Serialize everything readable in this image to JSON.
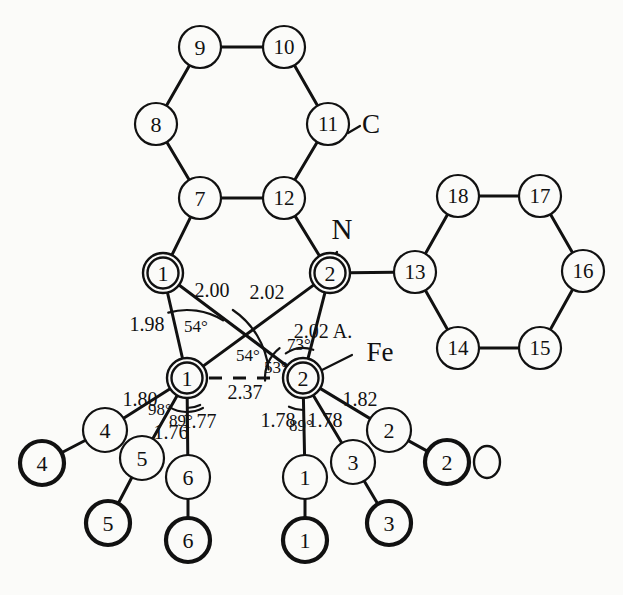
{
  "figure": {
    "type": "molecular-structure-diagram",
    "title": "",
    "background_color": "#fbfbf9",
    "line_color": "#111111",
    "unit_note": "2.02 A."
  },
  "chart_data": {
    "type": "diagram",
    "title": "",
    "xlabel": "",
    "ylabel": "",
    "atoms": [
      {
        "id": "ring1-7",
        "label": "7",
        "kind": "ring-carbon",
        "x": 200,
        "y": 198,
        "r": 21,
        "style": "thin"
      },
      {
        "id": "ring1-8",
        "label": "8",
        "kind": "ring-carbon",
        "x": 156,
        "y": 124,
        "r": 21,
        "style": "thin"
      },
      {
        "id": "ring1-9",
        "label": "9",
        "kind": "ring-carbon",
        "x": 200,
        "y": 47,
        "r": 21,
        "style": "thin"
      },
      {
        "id": "ring1-10",
        "label": "10",
        "kind": "ring-carbon",
        "x": 284,
        "y": 47,
        "r": 21,
        "style": "thin"
      },
      {
        "id": "ring1-11",
        "label": "11",
        "kind": "ring-carbon",
        "x": 328,
        "y": 124,
        "r": 21,
        "style": "thin"
      },
      {
        "id": "ring1-12",
        "label": "12",
        "kind": "ring-carbon",
        "x": 284,
        "y": 198,
        "r": 21,
        "style": "thin"
      },
      {
        "id": "ring2-13",
        "label": "13",
        "kind": "ring-carbon",
        "x": 415,
        "y": 272,
        "r": 21,
        "style": "thin"
      },
      {
        "id": "ring2-14",
        "label": "14",
        "kind": "ring-carbon",
        "x": 458,
        "y": 348,
        "r": 21,
        "style": "thin"
      },
      {
        "id": "ring2-15",
        "label": "15",
        "kind": "ring-carbon",
        "x": 540,
        "y": 348,
        "r": 21,
        "style": "thin"
      },
      {
        "id": "ring2-16",
        "label": "16",
        "kind": "ring-carbon",
        "x": 583,
        "y": 271,
        "r": 21,
        "style": "thin"
      },
      {
        "id": "ring2-17",
        "label": "17",
        "kind": "ring-carbon",
        "x": 540,
        "y": 196,
        "r": 21,
        "style": "thin"
      },
      {
        "id": "ring2-18",
        "label": "18",
        "kind": "ring-carbon",
        "x": 458,
        "y": 196,
        "r": 21,
        "style": "thin"
      },
      {
        "id": "n1",
        "label": "1",
        "kind": "nitrogen",
        "x": 163,
        "y": 273,
        "r": 20,
        "style": "double"
      },
      {
        "id": "n2",
        "label": "2",
        "kind": "nitrogen",
        "x": 330,
        "y": 273,
        "r": 20,
        "style": "double"
      },
      {
        "id": "fe1",
        "label": "1",
        "kind": "iron",
        "x": 187,
        "y": 378,
        "r": 20,
        "style": "double"
      },
      {
        "id": "fe2",
        "label": "2",
        "kind": "iron",
        "x": 303,
        "y": 378,
        "r": 20,
        "style": "double"
      },
      {
        "id": "c4",
        "label": "4",
        "kind": "carbonyl-c",
        "x": 105,
        "y": 430,
        "r": 22,
        "style": "thin"
      },
      {
        "id": "o4",
        "label": "4",
        "kind": "carbonyl-o",
        "x": 42,
        "y": 463,
        "r": 22,
        "style": "thick"
      },
      {
        "id": "c5",
        "label": "5",
        "kind": "carbonyl-c",
        "x": 142,
        "y": 458,
        "r": 22,
        "style": "thin"
      },
      {
        "id": "o5",
        "label": "5",
        "kind": "carbonyl-o",
        "x": 108,
        "y": 523,
        "r": 22,
        "style": "thick"
      },
      {
        "id": "c6",
        "label": "6",
        "kind": "carbonyl-c",
        "x": 188,
        "y": 477,
        "r": 22,
        "style": "thin"
      },
      {
        "id": "o6",
        "label": "6",
        "kind": "carbonyl-o",
        "x": 188,
        "y": 540,
        "r": 22,
        "style": "thick"
      },
      {
        "id": "c1",
        "label": "1",
        "kind": "carbonyl-c",
        "x": 305,
        "y": 477,
        "r": 22,
        "style": "thin"
      },
      {
        "id": "o1",
        "label": "1",
        "kind": "carbonyl-o",
        "x": 305,
        "y": 540,
        "r": 22,
        "style": "thick"
      },
      {
        "id": "c3",
        "label": "3",
        "kind": "carbonyl-c",
        "x": 353,
        "y": 462,
        "r": 22,
        "style": "thin"
      },
      {
        "id": "o3",
        "label": "3",
        "kind": "carbonyl-o",
        "x": 389,
        "y": 523,
        "r": 22,
        "style": "thick"
      },
      {
        "id": "c2",
        "label": "2",
        "kind": "carbonyl-c",
        "x": 389,
        "y": 430,
        "r": 22,
        "style": "thin"
      },
      {
        "id": "o2",
        "label": "2",
        "kind": "carbonyl-o",
        "x": 447,
        "y": 462,
        "r": 22,
        "style": "thick"
      }
    ],
    "bonds": [
      {
        "from": "ring1-7",
        "to": "ring1-8",
        "w": 3
      },
      {
        "from": "ring1-8",
        "to": "ring1-9",
        "w": 3
      },
      {
        "from": "ring1-9",
        "to": "ring1-10",
        "w": 3
      },
      {
        "from": "ring1-10",
        "to": "ring1-11",
        "w": 3
      },
      {
        "from": "ring1-11",
        "to": "ring1-12",
        "w": 3
      },
      {
        "from": "ring1-12",
        "to": "ring1-7",
        "w": 3
      },
      {
        "from": "ring1-7",
        "to": "n1",
        "w": 3
      },
      {
        "from": "ring1-12",
        "to": "n2",
        "w": 3
      },
      {
        "from": "ring2-13",
        "to": "ring2-14",
        "w": 3
      },
      {
        "from": "ring2-14",
        "to": "ring2-15",
        "w": 3
      },
      {
        "from": "ring2-15",
        "to": "ring2-16",
        "w": 3
      },
      {
        "from": "ring2-16",
        "to": "ring2-17",
        "w": 3
      },
      {
        "from": "ring2-17",
        "to": "ring2-18",
        "w": 3
      },
      {
        "from": "ring2-18",
        "to": "ring2-13",
        "w": 3
      },
      {
        "from": "n2",
        "to": "ring2-13",
        "w": 3
      },
      {
        "from": "n1",
        "to": "fe1",
        "w": 3
      },
      {
        "from": "n1",
        "to": "fe2",
        "w": 3
      },
      {
        "from": "n2",
        "to": "fe1",
        "w": 3
      },
      {
        "from": "n2",
        "to": "fe2",
        "w": 3
      },
      {
        "from": "fe1",
        "to": "c4",
        "w": 3
      },
      {
        "from": "c4",
        "to": "o4",
        "w": 3
      },
      {
        "from": "fe1",
        "to": "c5",
        "w": 3
      },
      {
        "from": "c5",
        "to": "o5",
        "w": 3
      },
      {
        "from": "fe1",
        "to": "c6",
        "w": 3
      },
      {
        "from": "c6",
        "to": "o6",
        "w": 3
      },
      {
        "from": "fe2",
        "to": "c1",
        "w": 3
      },
      {
        "from": "c1",
        "to": "o1",
        "w": 3
      },
      {
        "from": "fe2",
        "to": "c3",
        "w": 3
      },
      {
        "from": "c3",
        "to": "o3",
        "w": 3
      },
      {
        "from": "fe2",
        "to": "c2",
        "w": 3
      },
      {
        "from": "c2",
        "to": "o2",
        "w": 3
      }
    ],
    "dashed_bonds": [
      {
        "from": "fe1",
        "to": "fe2",
        "label": "2.37"
      }
    ],
    "leader_lines": [
      {
        "from_x": 348,
        "from_y": 133,
        "to_x": 360,
        "to_y": 126,
        "label": "C"
      },
      {
        "from_x": 337,
        "from_y": 252,
        "to_x": 330,
        "to_y": 262,
        "label": "N"
      },
      {
        "from_x": 322,
        "from_y": 370,
        "to_x": 352,
        "to_y": 355,
        "label": "Fe"
      }
    ],
    "element_labels": [
      {
        "id": "label-C",
        "text": "C",
        "x": 371,
        "y": 124,
        "size": 27
      },
      {
        "id": "label-N",
        "text": "N",
        "x": 342,
        "y": 229,
        "size": 29
      },
      {
        "id": "label-Fe",
        "text": "Fe",
        "x": 380,
        "y": 352,
        "size": 27
      },
      {
        "id": "label-O",
        "text": "O",
        "x": 487,
        "y": 462,
        "size": 22
      }
    ],
    "distance_labels": [
      {
        "id": "d-n1-fe1",
        "text": "1.98",
        "x": 147,
        "y": 324
      },
      {
        "id": "d-n1-fe2",
        "text": "2.00",
        "x": 212,
        "y": 290
      },
      {
        "id": "d-n2-fe1",
        "text": "2.02",
        "x": 267,
        "y": 292
      },
      {
        "id": "d-n2-fe2",
        "text": "2.02 A.",
        "x": 323,
        "y": 331
      },
      {
        "id": "d-fe1-fe2",
        "text": "2.37",
        "x": 245,
        "y": 392
      },
      {
        "id": "d-fe1-c4",
        "text": "1.80",
        "x": 140,
        "y": 399
      },
      {
        "id": "d-fe1-c5",
        "text": "1.76",
        "x": 171,
        "y": 432
      },
      {
        "id": "d-fe1-c6",
        "text": "1.77",
        "x": 199,
        "y": 421
      },
      {
        "id": "d-fe2-c1",
        "text": "1.78",
        "x": 278,
        "y": 420
      },
      {
        "id": "d-fe2-c3",
        "text": "1.78",
        "x": 325,
        "y": 420
      },
      {
        "id": "d-fe2-c2",
        "text": "1.82",
        "x": 360,
        "y": 399
      }
    ],
    "angle_labels": [
      {
        "id": "a-54-upper",
        "text": "54°",
        "x": 196,
        "y": 326
      },
      {
        "id": "a-54-lower",
        "text": "54°",
        "x": 248,
        "y": 355
      },
      {
        "id": "a-53",
        "text": "53°",
        "x": 276,
        "y": 367
      },
      {
        "id": "a-73",
        "text": "73°",
        "x": 299,
        "y": 344
      },
      {
        "id": "a-98",
        "text": "98°",
        "x": 160,
        "y": 409
      },
      {
        "id": "a-89-left",
        "text": "89°",
        "x": 181,
        "y": 420
      },
      {
        "id": "a-89-right",
        "text": "89°",
        "x": 301,
        "y": 425
      }
    ],
    "angle_arcs": [
      {
        "id": "arc-54-upper",
        "cx": 187,
        "cy": 378,
        "r": 68,
        "start": -106,
        "end": -58
      },
      {
        "id": "arc-54-lower",
        "cx": 187,
        "cy": 378,
        "r": 82,
        "start": -56,
        "end": -6
      },
      {
        "id": "arc-53",
        "cx": 303,
        "cy": 378,
        "r": 38,
        "start": 176,
        "end": 232
      },
      {
        "id": "arc-73",
        "cx": 303,
        "cy": 378,
        "r": 30,
        "start": 235,
        "end": 290
      },
      {
        "id": "arc-98",
        "cx": 187,
        "cy": 378,
        "r": 34,
        "start": 121,
        "end": 62
      },
      {
        "id": "arc-89l",
        "cx": 187,
        "cy": 378,
        "r": 30,
        "start": 64,
        "end": 90
      },
      {
        "id": "arc-89r",
        "cx": 303,
        "cy": 378,
        "r": 32,
        "start": 90,
        "end": 116
      }
    ]
  }
}
